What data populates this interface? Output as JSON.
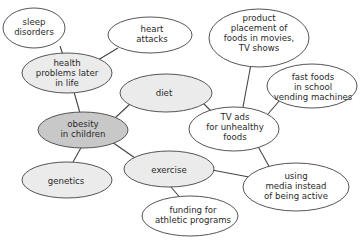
{
  "diagram": {
    "type": "concept-map",
    "colors": {
      "center_fill": "#c8c8c8",
      "primary_fill": "#ebebeb",
      "secondary_fill": "#ffffff",
      "stroke": "#555555",
      "edge": "#444444",
      "text": "#2a2a2a"
    },
    "nodes": [
      {
        "id": "obesity",
        "lines": [
          "obesity",
          "in children"
        ],
        "level": "center"
      },
      {
        "id": "health",
        "lines": [
          "health",
          "problems later",
          "in life"
        ],
        "level": "primary"
      },
      {
        "id": "diet",
        "lines": [
          "diet"
        ],
        "level": "primary"
      },
      {
        "id": "genetics",
        "lines": [
          "genetics"
        ],
        "level": "primary"
      },
      {
        "id": "exercise",
        "lines": [
          "exercise"
        ],
        "level": "primary"
      },
      {
        "id": "sleep",
        "lines": [
          "sleep",
          "disorders"
        ],
        "level": "secondary"
      },
      {
        "id": "heart",
        "lines": [
          "heart",
          "attacks"
        ],
        "level": "secondary"
      },
      {
        "id": "tvads",
        "lines": [
          "TV ads",
          "for unhealthy",
          "foods"
        ],
        "level": "secondary"
      },
      {
        "id": "product",
        "lines": [
          "product",
          "placement of",
          "foods in movies,",
          "TV shows"
        ],
        "level": "secondary"
      },
      {
        "id": "fastfoods",
        "lines": [
          "fast foods",
          "in school",
          "vending machines"
        ],
        "level": "secondary"
      },
      {
        "id": "media",
        "lines": [
          "using",
          "media instead",
          "of being active"
        ],
        "level": "secondary"
      },
      {
        "id": "funding",
        "lines": [
          "funding for",
          "athletic programs"
        ],
        "level": "secondary"
      }
    ],
    "edges": [
      [
        "sleep",
        "health"
      ],
      [
        "heart",
        "health"
      ],
      [
        "health",
        "obesity"
      ],
      [
        "obesity",
        "diet"
      ],
      [
        "obesity",
        "genetics"
      ],
      [
        "obesity",
        "exercise"
      ],
      [
        "diet",
        "tvads"
      ],
      [
        "product",
        "tvads"
      ],
      [
        "fastfoods",
        "tvads"
      ],
      [
        "tvads",
        "media"
      ],
      [
        "exercise",
        "media"
      ],
      [
        "exercise",
        "funding"
      ]
    ]
  }
}
